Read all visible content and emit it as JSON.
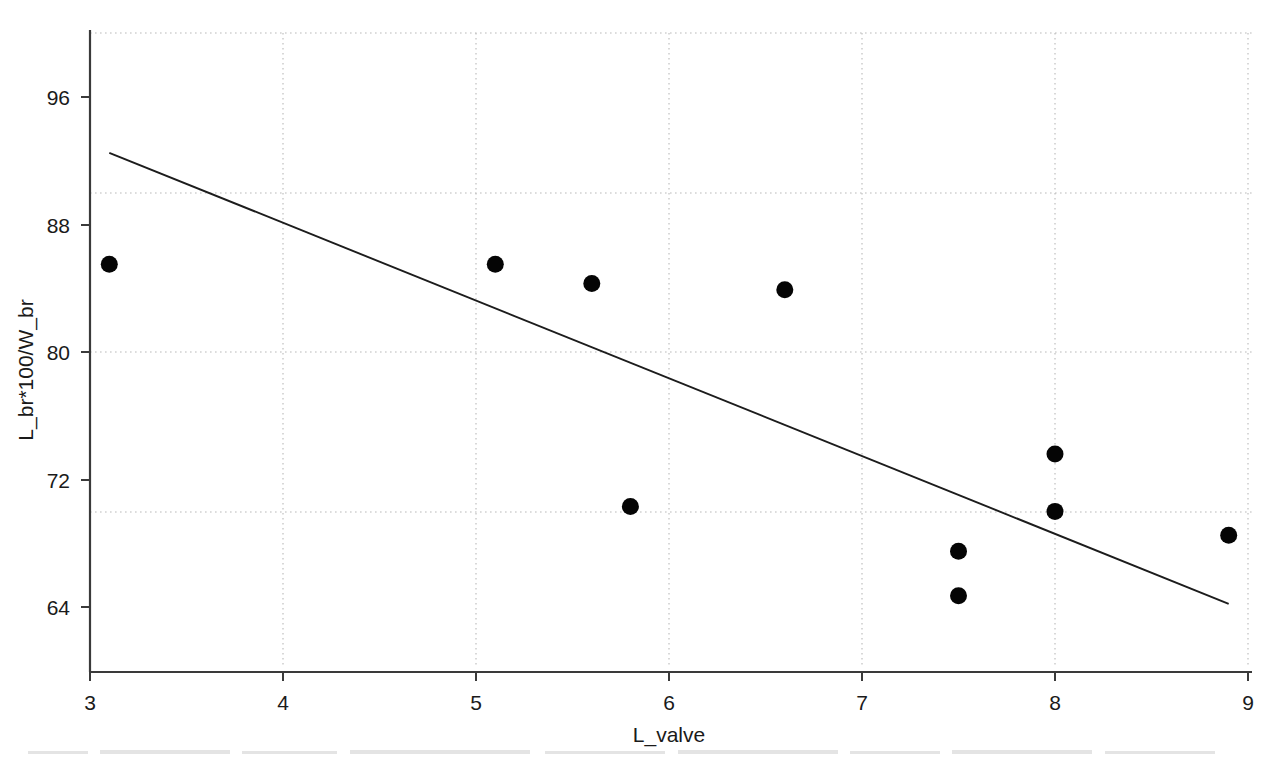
{
  "chart_data": {
    "type": "scatter",
    "title": "",
    "subtitle": "",
    "xlabel": "L_valve",
    "ylabel": "L_br*100/W_br",
    "xlim": [
      3,
      9
    ],
    "ylim": [
      60.3,
      99.2
    ],
    "xticks": [
      3,
      4,
      5,
      6,
      7,
      8,
      9
    ],
    "xtick_labels": [
      "3",
      "4",
      "5",
      "6",
      "7",
      "8",
      "9"
    ],
    "yticks": [
      64,
      72,
      80,
      88,
      96
    ],
    "ytick_labels": [
      "64",
      "72",
      "80",
      "88",
      "96"
    ],
    "gridlines": {
      "x": [
        4,
        5,
        6,
        7,
        8,
        9
      ],
      "y": [
        70,
        80,
        90,
        98.5
      ],
      "visible": true,
      "style": "dotted",
      "color": "#b9b9b9"
    },
    "legend": null,
    "legend_position": "none",
    "marker": {
      "shape": "circle",
      "color": "#050505",
      "size": 9
    },
    "points": [
      {
        "x": 3.1,
        "y": 85.5
      },
      {
        "x": 5.1,
        "y": 85.5
      },
      {
        "x": 5.6,
        "y": 84.3
      },
      {
        "x": 5.8,
        "y": 70.3
      },
      {
        "x": 6.6,
        "y": 83.9
      },
      {
        "x": 7.5,
        "y": 67.5
      },
      {
        "x": 7.5,
        "y": 64.7
      },
      {
        "x": 8.0,
        "y": 73.6
      },
      {
        "x": 8.0,
        "y": 70.0
      },
      {
        "x": 8.9,
        "y": 68.5
      }
    ],
    "series": [
      {
        "name": "observations",
        "type": "scatter",
        "x": [
          3.1,
          5.1,
          5.6,
          5.8,
          6.6,
          7.5,
          7.5,
          8.0,
          8.0,
          8.9
        ],
        "y": [
          85.5,
          85.5,
          84.3,
          70.3,
          83.9,
          67.5,
          64.7,
          73.6,
          70.0,
          68.5
        ]
      },
      {
        "name": "regression-line",
        "type": "line",
        "color": "#1c1c1c",
        "x": [
          3.1,
          8.9
        ],
        "y": [
          92.5,
          64.2
        ]
      }
    ],
    "trendline": {
      "x_start": 3.1,
      "y_start": 92.5,
      "x_end": 8.9,
      "y_end": 64.2,
      "slope": -4.879,
      "intercept": 107.62,
      "color": "#1c1c1c"
    },
    "annotations": [],
    "background_color": "#ffffff",
    "axis_color": "#3a3a3a"
  },
  "axes": {
    "x_title": "L_valve",
    "y_title": "L_br*100/W_br"
  }
}
